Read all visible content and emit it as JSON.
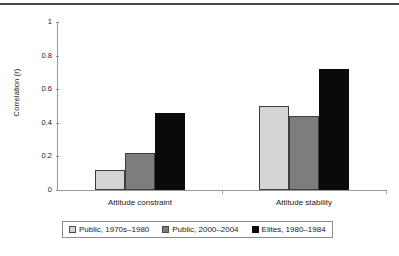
{
  "chart_data": {
    "type": "bar",
    "title": "",
    "xlabel": "",
    "ylabel": "Correlation (r)",
    "ylim": [
      0,
      1
    ],
    "yticks": [
      "0",
      "0.2",
      "0.4",
      "0.6",
      "0.8",
      "1"
    ],
    "ytick_values": [
      0,
      0.2,
      0.4,
      0.6,
      0.8,
      1
    ],
    "grid": false,
    "legend_position": "bottom",
    "categories": [
      "Attitude constraint",
      "Attitude stability"
    ],
    "series": [
      {
        "name": "Public, 1970s–1980",
        "color": "#d4d4d4",
        "values": [
          0.12,
          0.5
        ]
      },
      {
        "name": "Public, 2000–2004",
        "color": "#7d7d7d",
        "values": [
          0.22,
          0.44
        ]
      },
      {
        "name": "Elites, 1980–1984",
        "color": "#0a0a0a",
        "values": [
          0.46,
          0.72
        ]
      }
    ]
  },
  "axes": {
    "y_title": "Correlation (r)"
  }
}
